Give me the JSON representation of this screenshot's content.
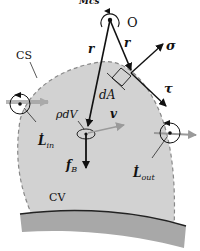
{
  "figure": {
    "top_label": "Ṁcs",
    "origin_label": "O",
    "control_surface_label": "CS",
    "control_volume_label": "CV",
    "position_vector_left": "r",
    "position_vector_right": "r",
    "normal_stress_label": "σ",
    "shear_stress_label": "τ",
    "area_element_label": "dA",
    "mass_element_label": "ρdV",
    "velocity_label": "v",
    "body_force_label": "f",
    "body_force_sub": "B",
    "L_in_label": "L̇",
    "L_in_sub": "in",
    "L_out_label": "L̇",
    "L_out_sub": "out"
  },
  "colors": {
    "cv_fill": "#d2d2d2",
    "cs_dash": "#888888",
    "wall": "#a8a8a8",
    "vector": "#111111",
    "flow_arrow": "#9a9a9a"
  }
}
